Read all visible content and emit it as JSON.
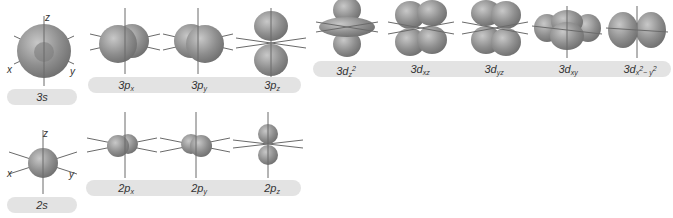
{
  "diagram": {
    "colors": {
      "orbital_fill": "#8a8a8a",
      "orbital_highlight": "#c4c4c4",
      "axis_line": "#6a6a6a",
      "label_bar": "#e3e3e3",
      "label_text": "#333333"
    },
    "axis_labels": {
      "x": "x",
      "y": "y",
      "z": "z"
    },
    "rows": [
      {
        "shell": 3,
        "s": {
          "label": "3s"
        },
        "p": [
          {
            "n": "3p",
            "sub": "x"
          },
          {
            "n": "3p",
            "sub": "y"
          },
          {
            "n": "3p",
            "sub": "z"
          }
        ],
        "d": [
          {
            "n": "3d",
            "sub": "z",
            "sup": "2"
          },
          {
            "n": "3d",
            "sub": "xz"
          },
          {
            "n": "3d",
            "sub": "yz"
          },
          {
            "n": "3d",
            "sub": "xy"
          },
          {
            "n": "3d",
            "sub": "x",
            "sup": "2",
            "tail": "− y",
            "tailsup": "2"
          }
        ]
      },
      {
        "shell": 2,
        "s": {
          "label": "2s"
        },
        "p": [
          {
            "n": "2p",
            "sub": "x"
          },
          {
            "n": "2p",
            "sub": "y"
          },
          {
            "n": "2p",
            "sub": "z"
          }
        ]
      }
    ]
  }
}
